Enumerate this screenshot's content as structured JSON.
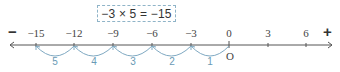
{
  "equation": "−3 × 5 = −15",
  "signs": {
    "negative": "−",
    "positive": "+"
  },
  "origin_label": "O",
  "colors": {
    "axis": "#555555",
    "arc": "#7fa9c2",
    "arc_label": "#6a9ab5",
    "box_border": "#8fb4c8"
  },
  "number_line": {
    "ticks": [
      {
        "value": -15,
        "label": "−15",
        "x": 36
      },
      {
        "value": -12,
        "label": "−12",
        "x": 74
      },
      {
        "value": -9,
        "label": "−9",
        "x": 113
      },
      {
        "value": -6,
        "label": "−6",
        "x": 152
      },
      {
        "value": -3,
        "label": "−3",
        "x": 191
      },
      {
        "value": 0,
        "label": "0",
        "x": 229
      },
      {
        "value": 3,
        "label": "3",
        "x": 268
      },
      {
        "value": 6,
        "label": "6",
        "x": 306
      }
    ],
    "jumps": [
      {
        "step": "1",
        "from": 0,
        "to": -3
      },
      {
        "step": "2",
        "from": -3,
        "to": -6
      },
      {
        "step": "3",
        "from": -6,
        "to": -9
      },
      {
        "step": "4",
        "from": -9,
        "to": -12
      },
      {
        "step": "5",
        "from": -12,
        "to": -15
      }
    ]
  }
}
